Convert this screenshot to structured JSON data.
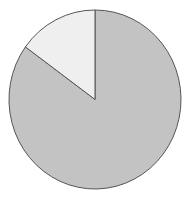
{
  "chart_data": {
    "type": "pie",
    "title": "",
    "categories": [
      "Slice A",
      "Slice B"
    ],
    "values": [
      85,
      15
    ],
    "colors": [
      "#c3c3c3",
      "#efefef"
    ],
    "stroke_color": "#555555",
    "start_angle_deg": 0,
    "direction": "clockwise",
    "legend": "none",
    "labels_visible": false
  }
}
